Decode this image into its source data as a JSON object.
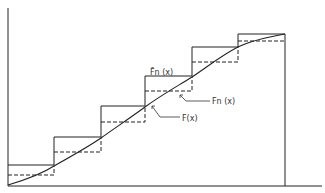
{
  "diagram": {
    "labels": {
      "upper_step": "F̄n (x)",
      "lower_step": "Fn (x)",
      "true_cdf": "F(x)"
    },
    "step_breaks_px": [
      8,
      54,
      101,
      145,
      192,
      238,
      285
    ],
    "upper_levels_px": [
      165,
      137,
      106,
      76,
      47,
      34
    ],
    "lower_levels_px": [
      175,
      152,
      122,
      91,
      62,
      41
    ],
    "curve_points_px": [
      [
        8,
        185
      ],
      [
        54,
        166
      ],
      [
        101,
        138
      ],
      [
        145,
        107
      ],
      [
        192,
        77
      ],
      [
        238,
        47
      ],
      [
        285,
        34
      ]
    ],
    "colors": {
      "line": "#222222",
      "background": "#ffffff"
    }
  }
}
